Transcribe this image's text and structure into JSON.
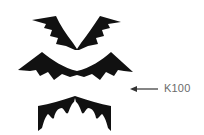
{
  "diagram": {
    "shapes": [
      {
        "name": "top-bat-wing-shape",
        "description": "V-shaped bat wings"
      },
      {
        "name": "middle-bat-wing-shape",
        "description": "wide curved bat wings"
      },
      {
        "name": "bottom-bat-wing-shape",
        "description": "arched bat wing with central spike"
      }
    ],
    "callout": {
      "label": "K100",
      "arrow_direction": "left"
    },
    "colors": {
      "fill": "#111111",
      "label": "#6b6b6b",
      "arrow": "#333333",
      "background": "#ffffff"
    }
  }
}
